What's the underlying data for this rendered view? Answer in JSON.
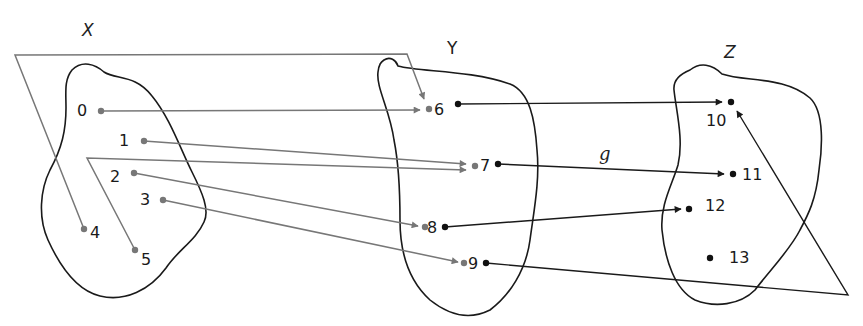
{
  "sets": {
    "X": {
      "label": "X",
      "elements": [
        "0",
        "1",
        "2",
        "3",
        "4",
        "5"
      ]
    },
    "Y": {
      "label": "Y",
      "elements": [
        "6",
        "7",
        "8",
        "9"
      ]
    },
    "Z": {
      "label": "Z",
      "elements": [
        "10",
        "11",
        "12",
        "13"
      ]
    }
  },
  "functions": {
    "f": {
      "label": "",
      "mapping": [
        {
          "from": "0",
          "to": "6"
        },
        {
          "from": "1",
          "to": "7"
        },
        {
          "from": "2",
          "to": "8"
        },
        {
          "from": "3",
          "to": "9"
        },
        {
          "from": "4",
          "to": "6"
        },
        {
          "from": "5",
          "to": "7"
        }
      ],
      "color": "#777777"
    },
    "g": {
      "label": "g",
      "mapping": [
        {
          "from": "6",
          "to": "10"
        },
        {
          "from": "7",
          "to": "11"
        },
        {
          "from": "8",
          "to": "12"
        },
        {
          "from": "9",
          "to": "10"
        }
      ],
      "color": "#1a1a1a"
    }
  },
  "labels": {
    "x0": "0",
    "x1": "1",
    "x2": "2",
    "x3": "3",
    "x4": "4",
    "x5": "5",
    "y6": "6",
    "y7": "7",
    "y8": "8",
    "y9": "9",
    "z10": "10",
    "z11": "11",
    "z12": "12",
    "z13": "13"
  }
}
